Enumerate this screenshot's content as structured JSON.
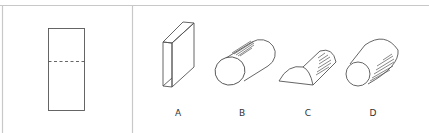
{
  "figure": {
    "type": "folding-puzzle",
    "left_panel": {
      "shape": "rectangle",
      "fold_line": "dashed horizontal line"
    },
    "options": [
      {
        "label": "A",
        "shape": "rectangular box"
      },
      {
        "label": "B",
        "shape": "cylinder"
      },
      {
        "label": "C",
        "shape": "half cylinder"
      },
      {
        "label": "D",
        "shape": "truncated cone"
      }
    ]
  },
  "colors": {
    "line": "#555555",
    "border": "#c8c8c8"
  }
}
